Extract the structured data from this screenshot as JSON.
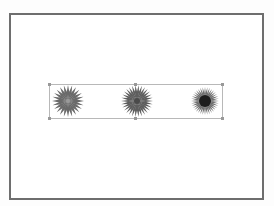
{
  "canvas": {
    "border_color": "#6e6e6e",
    "background": "#ffffff"
  },
  "selection": {
    "border_color": "#b8b8b8",
    "handle_color": "#999999"
  },
  "flowers": [
    {
      "name": "flower-1",
      "petal_color": "#6a6a6a",
      "center_color": "#9a9a9a",
      "petals": 24
    },
    {
      "name": "flower-2",
      "petal_color": "#5e5e5e",
      "center_color": "#4a4a4a",
      "petals": 30
    },
    {
      "name": "flower-3",
      "petal_color": "#707070",
      "center_color": "#1e1e1e",
      "petals": 36
    }
  ]
}
